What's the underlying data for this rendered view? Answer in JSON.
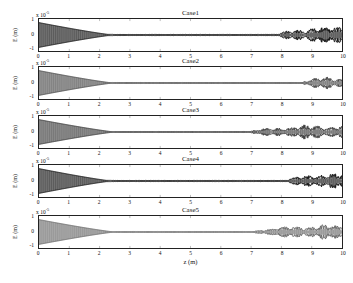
{
  "figure": {
    "background": "#ffffff",
    "axis_color": "#222222",
    "xlabel": "z (m)",
    "ylabel": "E (m)",
    "y_multiplier_prefix": "x 10",
    "y_multiplier_exponent": "-5",
    "x_ticks": [
      "0",
      "1",
      "2",
      "3",
      "4",
      "5",
      "6",
      "7",
      "8",
      "9",
      "10"
    ],
    "y_ticks": [
      "1",
      "0",
      "-1"
    ]
  },
  "chart_data": {
    "type": "line",
    "title": "",
    "xlabel": "z (m)",
    "ylabel": "E (m)",
    "xlim": [
      0,
      10
    ],
    "ylim": [
      -1.2,
      1.2
    ],
    "y_scale": 1e-05,
    "grid": false,
    "legend_position": "none",
    "panels": [
      {
        "title": "Case1",
        "color": "#111111",
        "envelope_start_amplitude": 1.0,
        "collapse_z": 2.45,
        "quiet_amplitude": 0.05,
        "noise_onset_z": 7.9,
        "noise_peak_amplitude": 0.62,
        "description": "Envelope collapses to near zero by z=2.45, remains flat, then a noisy broadband burst grows from z=7.9 to z=10."
      },
      {
        "title": "Case2",
        "color": "#4a4a4a",
        "envelope_start_amplitude": 1.0,
        "collapse_z": 2.45,
        "quiet_amplitude": 0.04,
        "noise_onset_z": 8.7,
        "noise_peak_amplitude": 0.45,
        "description": "Same collapse, latest noise onset at z=8.7 with moderate amplitude."
      },
      {
        "title": "Case3",
        "color": "#3a3a3a",
        "envelope_start_amplitude": 1.0,
        "collapse_z": 2.5,
        "quiet_amplitude": 0.04,
        "noise_onset_z": 7.0,
        "noise_peak_amplitude": 0.5,
        "description": "Earliest onset at z=7.0, sustained modulated noise to z=10."
      },
      {
        "title": "Case4",
        "color": "#111111",
        "envelope_start_amplitude": 1.0,
        "collapse_z": 2.4,
        "quiet_amplitude": 0.05,
        "noise_onset_z": 8.2,
        "noise_peak_amplitude": 0.58,
        "description": "Collapse at z=2.4, strong dark noise burst from z=8.2."
      },
      {
        "title": "Case5",
        "color": "#6a6a6a",
        "envelope_start_amplitude": 1.0,
        "collapse_z": 2.5,
        "quiet_amplitude": 0.04,
        "noise_onset_z": 7.1,
        "noise_peak_amplitude": 0.52,
        "description": "Grey trace, onset at z=7.1 with beaded amplitude modulation."
      }
    ]
  }
}
